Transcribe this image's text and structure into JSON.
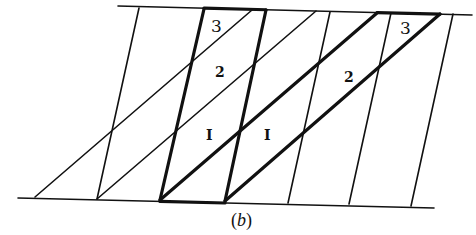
{
  "figure": {
    "caption": "(b)",
    "caption_parts": {
      "open": "(",
      "letter": "b",
      "close": ")"
    },
    "colors": {
      "ink": "#111111",
      "background": "#ffffff"
    },
    "boundaries": {
      "top": {
        "x1": 118,
        "y1": 6,
        "x2": 472,
        "y2": 15,
        "thick_segments": [
          [
            204,
            266
          ],
          [
            377,
            440
          ]
        ]
      },
      "bottom": {
        "x1": 18,
        "y1": 198,
        "x2": 434,
        "y2": 208,
        "thick_segments": [
          [
            160,
            225
          ]
        ]
      }
    },
    "steep_lines": [
      {
        "x1": 139,
        "y1": 8,
        "x2": 97,
        "y2": 199,
        "weight": "thin"
      },
      {
        "x1": 204,
        "y1": 9,
        "x2": 160,
        "y2": 200,
        "weight": "thick"
      },
      {
        "x1": 266,
        "y1": 10,
        "x2": 225,
        "y2": 201,
        "weight": "thick"
      },
      {
        "x1": 330,
        "y1": 12,
        "x2": 288,
        "y2": 203,
        "weight": "thin"
      },
      {
        "x1": 391,
        "y1": 13,
        "x2": 349,
        "y2": 204,
        "weight": "thin"
      },
      {
        "x1": 453,
        "y1": 14,
        "x2": 411,
        "y2": 206,
        "weight": "thin"
      }
    ],
    "diagonal_lines": [
      {
        "x1": 35,
        "y1": 197,
        "x2": 252,
        "y2": 10,
        "weight": "thin"
      },
      {
        "x1": 97,
        "y1": 199,
        "x2": 316,
        "y2": 11,
        "weight": "thin"
      },
      {
        "x1": 160,
        "y1": 200,
        "x2": 377,
        "y2": 13,
        "weight": "thick"
      },
      {
        "x1": 225,
        "y1": 201,
        "x2": 440,
        "y2": 14,
        "weight": "thick"
      }
    ],
    "labels": [
      {
        "text": "3",
        "x": 211,
        "y": 32,
        "style": "large"
      },
      {
        "text": "2",
        "x": 215,
        "y": 77,
        "style": "small"
      },
      {
        "text": "I",
        "x": 206,
        "y": 140,
        "style": "small"
      },
      {
        "text": "I",
        "x": 264,
        "y": 140,
        "style": "small"
      },
      {
        "text": "2",
        "x": 344,
        "y": 82,
        "style": "small"
      },
      {
        "text": "3",
        "x": 400,
        "y": 34,
        "style": "large"
      }
    ]
  }
}
